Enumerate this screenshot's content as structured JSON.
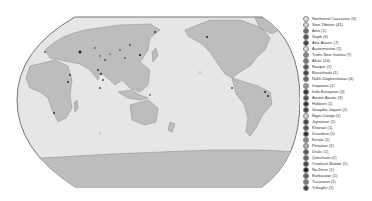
{
  "map": {
    "projection": "robinson-pacific-centered",
    "ocean_color": "#e6e6e6",
    "land_color": "#bdbdbd",
    "border_color": "#7a7a7a",
    "outline_color": "#555555"
  },
  "legend": {
    "items": [
      {
        "label": "Northwest Caucasian (3)",
        "color": "#e0e0e0"
      },
      {
        "label": "Sino-Tibetan (41)",
        "color": "#cfcfcf"
      },
      {
        "label": "Ainu (1)",
        "color": "#6a6a6a"
      },
      {
        "label": "Sepik (6)",
        "color": "#555555"
      },
      {
        "label": "Afro-Asiatic (7)",
        "color": "#444444"
      },
      {
        "label": "Austronesian (1)",
        "color": "#dddddd"
      },
      {
        "label": "Trans-New Guinea (7)",
        "color": "#888888"
      },
      {
        "label": "Altaic (14)",
        "color": "#777777"
      },
      {
        "label": "Basque (1)",
        "color": "#555555"
      },
      {
        "label": "Burushaski (1)",
        "color": "#444444"
      },
      {
        "label": "Nakh-Daghestanian (4)",
        "color": "#666666"
      },
      {
        "label": "Iroquoian (1)",
        "color": "#999999"
      },
      {
        "label": "Indo-European (4)",
        "color": "#333333"
      },
      {
        "label": "Austro-Asiatic (3)",
        "color": "#555555"
      },
      {
        "label": "Hokkien (1)",
        "color": "#333333"
      },
      {
        "label": "Vasqalia-Jaquati (1)",
        "color": "#444444"
      },
      {
        "label": "Niger-Congo (1)",
        "color": "#cccccc"
      },
      {
        "label": "Japanese (1)",
        "color": "#444444"
      },
      {
        "label": "Khoisan (1)",
        "color": "#555555"
      },
      {
        "label": "Dravidian (5)",
        "color": "#333333"
      },
      {
        "label": "Kerala (1)",
        "color": "#888888"
      },
      {
        "label": "Penutian (1)",
        "color": "#aaaaaa"
      },
      {
        "label": "Uralic (1)",
        "color": "#555555"
      },
      {
        "label": "Quechuan (2)",
        "color": "#666666"
      },
      {
        "label": "Yurakaré-Mande (1)",
        "color": "#444444"
      },
      {
        "label": "Na-Dene (1)",
        "color": "#222222"
      },
      {
        "label": "Barbacoan (1)",
        "color": "#666666"
      },
      {
        "label": "Tucanoan (1)",
        "color": "#777777"
      },
      {
        "label": "Yukaghir (1)",
        "color": "#444444"
      }
    ]
  }
}
